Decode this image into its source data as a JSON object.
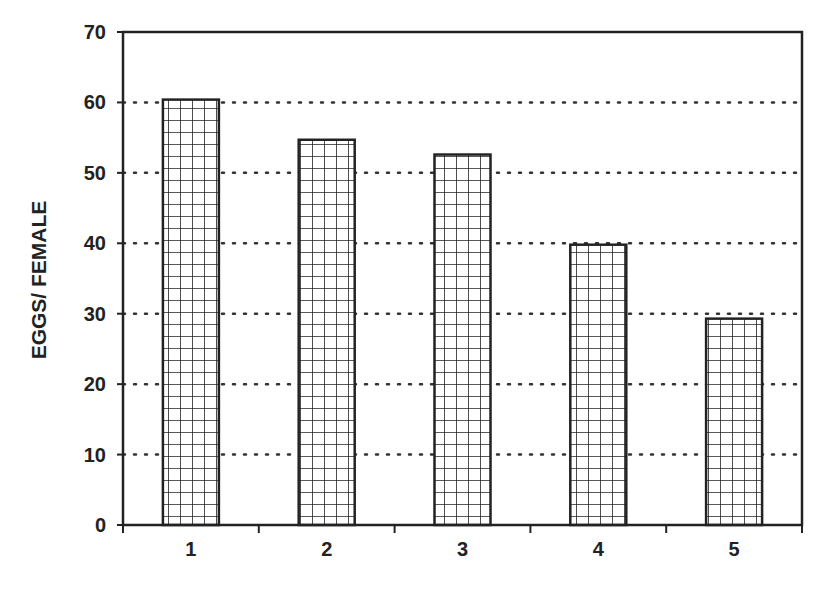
{
  "chart_data": {
    "type": "bar",
    "title": "",
    "xlabel": "",
    "ylabel": "EGGS/ FEMALE",
    "categories": [
      "1",
      "2",
      "3",
      "4",
      "5"
    ],
    "values": [
      60.4,
      54.7,
      52.6,
      39.8,
      29.3
    ],
    "ylim": [
      0,
      70
    ],
    "yticks": [
      0,
      10,
      20,
      30,
      40,
      50,
      60,
      70
    ],
    "grid": "horizontal dotted",
    "legend": null,
    "bar_fill": "crosshatch grid pattern",
    "colors": {
      "bar_stroke": "#222222",
      "grid": "#333333",
      "background": "#ffffff"
    }
  }
}
